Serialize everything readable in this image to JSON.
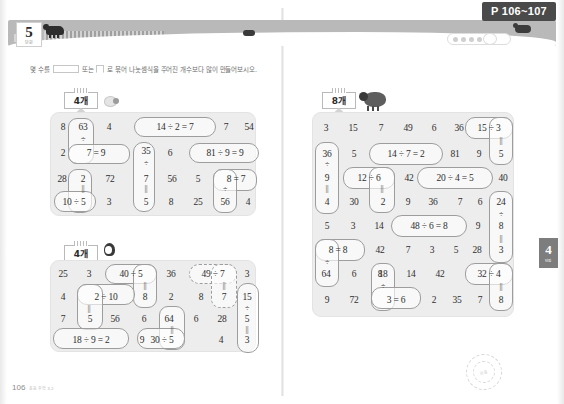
{
  "header": {
    "chapter_number": "5",
    "chapter_sub": "단원",
    "page_tag": "P 106~107"
  },
  "instruction": {
    "before_long_box": "몇 수를",
    "between_boxes": "또는",
    "after_square_box": "로 묶어 나눗셈식을 주어진 개수보다 많이 만들어보시오."
  },
  "left_page": {
    "folio": "106",
    "folio_note": "초등 수학 3-2",
    "puzzle_1": {
      "count_label": "4개",
      "cols": 7,
      "rows": 4,
      "cells": [
        "8",
        "63",
        "4",
        "14",
        "÷",
        "2",
        "=",
        "2",
        "7",
        "=",
        "9",
        "35",
        "6",
        "81",
        "28",
        "2",
        "72",
        "÷",
        "7",
        "56",
        "5",
        "10",
        "÷",
        "5",
        "3",
        "5",
        "8",
        "25"
      ],
      "grid_text": [
        [
          "8",
          "63",
          "4",
          "14 ÷ 2 = 7",
          "",
          "7",
          "54"
        ],
        [
          "2",
          "7 = 9",
          "",
          "35",
          "6",
          "81 ÷ 9 = 9",
          ""
        ],
        [
          "28",
          "2",
          "72",
          "7",
          "56",
          "5",
          "8 = 7"
        ],
        [
          "10 ÷ 5",
          "",
          "3",
          "5",
          "8",
          "25",
          "56",
          "4"
        ]
      ],
      "equations_found": [
        "63 ÷ 7 = 9",
        "14 ÷ 2 = 7",
        "81 ÷ 9 = 9",
        "35 ÷ 7 = 5",
        "10 ÷ 5 = 2",
        "56 ÷ 8 = 7"
      ]
    },
    "puzzle_2": {
      "count_label": "4개",
      "cols": 7,
      "rows": 4,
      "equations_found": [
        "40 ÷ 5 = 8",
        "49 ÷ 7 = 7",
        "2 ÷ 10 = 5",
        "18 ÷ 9 = 2",
        "30 ÷ 5 = 6",
        "15 ÷ 5 = 3"
      ]
    }
  },
  "right_page": {
    "puzzle_3": {
      "count_label": "8개",
      "cols": 7,
      "rows": 7,
      "equations_found": [
        "15 ÷ 3 = 5",
        "14 ÷ 7 = 2",
        "36 ÷ 9 = 4",
        "12 ÷ 6 = 2",
        "20 ÷ 4 = 5",
        "24 ÷ 8 = 3",
        "48 ÷ 6 = 8",
        "8 = 8",
        "64 ÷ 8",
        "18 ÷ 3 = 6",
        "32 ÷ 4 = 8"
      ]
    },
    "side_tab": {
      "number": "4",
      "sub": "단원"
    },
    "stamp_outer": "수학의 기본기",
    "stamp_inner": "인증"
  },
  "grids": {
    "g1": {
      "rows": [
        [
          "8",
          "63",
          "4",
          "14",
          "÷",
          "2",
          "=",
          "7",
          "7",
          "54"
        ],
        [
          "2",
          "",
          "7",
          "=",
          "9",
          "35",
          "6",
          "81",
          "÷",
          "9",
          "=",
          "9"
        ],
        [
          "28",
          "2",
          "72",
          "7",
          "56",
          "5",
          "8",
          "=",
          "7"
        ],
        [
          "10",
          "÷",
          "5",
          "3",
          "5",
          "8",
          "25",
          "56",
          "4"
        ]
      ]
    }
  },
  "puzzle1_cells": [
    [
      "8",
      "63",
      "4",
      "14",
      "÷ 2",
      "=7",
      "7",
      "54"
    ],
    [
      "2",
      "÷",
      "",
      "35",
      "6",
      "81",
      "÷9",
      "=9"
    ],
    [
      "28",
      "7 = 9",
      "72",
      "÷",
      "56",
      "5",
      "8",
      "= 7"
    ],
    [
      "",
      "2",
      "",
      "7",
      "",
      "",
      "÷",
      ""
    ],
    [
      "10 ÷ 5",
      "",
      "3",
      "5",
      "8",
      "25",
      "56",
      "4"
    ]
  ],
  "p1": {
    "r1": [
      "8",
      "63",
      "4",
      "14 ÷ 2 = 7",
      "7",
      "54"
    ],
    "r2": [
      "2",
      "÷",
      "",
      "35",
      "6",
      "81 ÷ 9 = 9"
    ],
    "r3": [
      "",
      "7 = 9",
      "",
      "÷",
      "",
      ""
    ],
    "r4": [
      "28",
      "2",
      "72",
      "7",
      "56",
      "5",
      "8 = 7"
    ],
    "r5": [
      "",
      "||",
      "",
      "||",
      "",
      "",
      "÷"
    ],
    "r6": [
      "10 ÷ 5",
      "",
      "3",
      "5",
      "8",
      "25",
      "56",
      "4"
    ]
  },
  "p1_flat": {
    "row1": [
      "8",
      "63",
      "4",
      "14",
      "÷",
      "2",
      "=",
      "7",
      "7",
      "54"
    ],
    "row2": [
      "2",
      "÷",
      "7",
      "=",
      "9",
      "35",
      "6",
      "81",
      "÷",
      "9",
      "=",
      "9"
    ],
    "row3": [
      "28",
      "2",
      "72",
      "÷",
      "7",
      "56",
      "5",
      "8",
      "=",
      "7"
    ],
    "row4": [
      "10",
      "÷",
      "5",
      "3",
      "||",
      "5",
      "8",
      "25",
      "56",
      "4"
    ]
  },
  "p2_flat": {
    "row1": [
      "25",
      "3",
      "40",
      "÷",
      "5",
      "36",
      "49",
      "÷",
      "7",
      "3"
    ],
    "row2": [
      "4",
      "2",
      "÷",
      "10",
      "||",
      "8",
      "2",
      "8",
      "||",
      "7",
      "15"
    ],
    "row3": [
      "7",
      "||",
      "5",
      "56",
      "6",
      "64",
      "6",
      "28",
      "÷",
      "5"
    ],
    "row4": [
      "18",
      "÷",
      "9",
      "=",
      "2",
      "9",
      "30",
      "÷",
      "5",
      "4",
      "||",
      "3"
    ]
  },
  "p3_flat": {
    "row1": [
      "3",
      "15",
      "7",
      "49",
      "6",
      "36",
      "15",
      "÷",
      "3"
    ],
    "row2": [
      "36",
      "5",
      "14",
      "÷",
      "7",
      "=",
      "2",
      "81",
      "9",
      "||",
      "5"
    ],
    "row3": [
      "÷",
      "9",
      "12",
      "÷",
      "6",
      "42",
      "20",
      "÷",
      "4",
      "=",
      "5",
      "40"
    ],
    "row4": [
      "||",
      "4",
      "30",
      "||",
      "2",
      "9",
      "36",
      "7",
      "6",
      "24"
    ],
    "row5": [
      "5",
      "3",
      "14",
      "48",
      "÷",
      "6",
      "=",
      "8",
      "9",
      "÷",
      "8"
    ],
    "row6": [
      "8",
      "=",
      "8",
      "42",
      "7",
      "3",
      "5",
      "28",
      "||",
      "3"
    ],
    "row7": [
      "÷",
      "64",
      "6",
      "8",
      "18",
      "14",
      "42",
      "32",
      "÷",
      "4"
    ],
    "row8": [
      "9",
      "72",
      "3",
      "=",
      "6",
      "2",
      "35",
      "7",
      "||",
      "8"
    ]
  },
  "puzzle_left_1_rows": [
    [
      "8",
      "63",
      "4",
      "14 ÷ 2 = 7",
      "",
      "7",
      "54"
    ],
    [
      "2",
      "7 = 9",
      "",
      "35",
      "6",
      "81 ÷ 9 = 9",
      ""
    ],
    [
      "28",
      "2",
      "72",
      "7",
      "56",
      "5",
      "8 = 7"
    ],
    [
      "10 ÷ 5",
      "",
      "3",
      "5",
      "8",
      "25",
      "56",
      "4"
    ]
  ],
  "puzzle_left_2_rows": [
    [
      "25",
      "3",
      "40 ÷ 5",
      "36",
      "49 ÷ 7",
      "3"
    ],
    [
      "4",
      "2 ÷ 10",
      "8",
      "2",
      "8",
      "7",
      "15"
    ],
    [
      "7",
      "5",
      "56",
      "6",
      "64",
      "6",
      "28",
      "5"
    ],
    [
      "18 ÷ 9 = 2",
      "9",
      "30 ÷ 5",
      "4",
      "3"
    ]
  ],
  "puzzle_right_rows": [
    [
      "3",
      "15",
      "7",
      "49",
      "6",
      "36",
      "15 ÷ 3"
    ],
    [
      "36",
      "5",
      "14 ÷ 7 = 2",
      "81",
      "9",
      "5"
    ],
    [
      "9",
      "12 ÷ 6",
      "42",
      "20 ÷ 4 = 5",
      "40"
    ],
    [
      "4",
      "30",
      "2",
      "9",
      "36",
      "7",
      "6",
      "24"
    ],
    [
      "5",
      "3",
      "14",
      "48 ÷ 6 = 8",
      "9",
      "8"
    ],
    [
      "8 = 8",
      "42",
      "7",
      "3",
      "5",
      "28",
      "3"
    ],
    [
      "64",
      "6",
      "8",
      "18",
      "14",
      "42",
      "32 ÷ 4"
    ],
    [
      "9",
      "72",
      "3 = 6",
      "2",
      "35",
      "7",
      "8"
    ]
  ]
}
